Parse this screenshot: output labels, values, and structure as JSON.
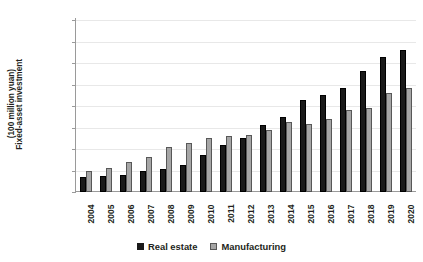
{
  "chart_data": {
    "type": "bar",
    "title": "",
    "subtitle": "",
    "xlabel": "",
    "ylabel": "Fixed-asset investment (100 million yuan)",
    "ylabel_lines": [
      "Fixed-asset investment",
      "(100 million yuan)"
    ],
    "categories": [
      "2004",
      "2005",
      "2006",
      "2007",
      "2008",
      "2009",
      "2010",
      "2011",
      "2012",
      "2013",
      "2014",
      "2015",
      "2016",
      "2017",
      "2018",
      "2019",
      "2020"
    ],
    "series": [
      {
        "name": "Real estate",
        "color": "#1a1a1a",
        "values": [
          1400,
          1500,
          1600,
          2000,
          2100,
          2500,
          3400,
          4400,
          5000,
          6200,
          7000,
          8600,
          9000,
          9700,
          11300,
          12600,
          13200
        ]
      },
      {
        "name": "Manufacturing",
        "color": "#a6a6a6",
        "values": [
          2000,
          2200,
          2800,
          3300,
          4200,
          4600,
          5000,
          5200,
          5300,
          5800,
          6500,
          6300,
          6800,
          7600,
          7800,
          9200,
          9700
        ]
      }
    ],
    "ylim": [
      0,
      16000
    ],
    "yticks": [
      0,
      2000,
      4000,
      6000,
      8000,
      10000,
      12000,
      14000,
      16000
    ],
    "ytick_labels": [
      "0",
      "2,000",
      "4,000",
      "6,000",
      "8,000",
      "10,000",
      "12,000",
      "14,000",
      "16,000"
    ],
    "grid": true,
    "grid_axis": "y",
    "legend_position": "bottom-center",
    "legend_entries": [
      "Real estate",
      "Manufacturing"
    ]
  }
}
